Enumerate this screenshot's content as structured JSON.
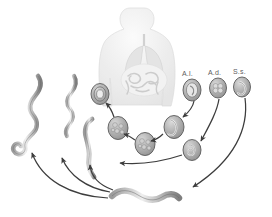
{
  "figure": {
    "background_color": "#ffffff",
    "ink_color": "#4a4a4a",
    "width": 272,
    "height": 217
  },
  "host": {
    "name": "human-body-silhouette",
    "description": "Translucent grey human torso showing lungs and intestinal tract",
    "fill": "#ededed",
    "organ_fill": "#dcdcdc",
    "x": 118,
    "y": 8,
    "w": 52,
    "h": 98
  },
  "species_labels": [
    {
      "id": "ai",
      "text": "A.l.",
      "x": 182,
      "y": 70,
      "egg_cx": 192,
      "egg_cy": 90,
      "egg_rx": 9,
      "egg_ry": 11,
      "egg_type": "ring-ovum"
    },
    {
      "id": "ad",
      "text": "A.d.",
      "x": 208,
      "y": 69,
      "egg_cx": 218,
      "egg_cy": 88,
      "egg_rx": 8.5,
      "egg_ry": 10,
      "egg_type": "cleaved-ovum"
    },
    {
      "id": "ss",
      "text": "S.s.",
      "x": 233,
      "y": 68,
      "egg_cx": 242,
      "egg_cy": 87,
      "egg_rx": 8.5,
      "egg_ry": 10,
      "egg_type": "larvated-ovum"
    }
  ],
  "ova": [
    {
      "id": "ovum-upper-left",
      "cx": 100,
      "cy": 94,
      "rx": 9,
      "ry": 10.5,
      "type": "ring-ovum",
      "stage": "unfertilized egg"
    },
    {
      "id": "ovum-mid-left",
      "cx": 118,
      "cy": 128,
      "rx": 10,
      "ry": 11.5,
      "type": "morula-ovum",
      "stage": "developing morula"
    },
    {
      "id": "ovum-center",
      "cx": 145,
      "cy": 144,
      "rx": 10,
      "ry": 11.5,
      "type": "morula-ovum",
      "stage": "developing morula"
    },
    {
      "id": "ovum-mid-right",
      "cx": 174,
      "cy": 127,
      "rx": 10,
      "ry": 11.5,
      "type": "larvated-ovum",
      "stage": "larvated egg"
    },
    {
      "id": "ovum-lower-right",
      "cx": 192,
      "cy": 150,
      "rx": 9,
      "ry": 10.5,
      "type": "coiled-ovum",
      "stage": "coiled larva in egg"
    }
  ],
  "worms": [
    {
      "id": "adult-worm-1",
      "label": "adult worm, sinuous",
      "x": 22,
      "y": 75,
      "w": 34,
      "h": 72
    },
    {
      "id": "adult-worm-2",
      "label": "adult worm, sinuous",
      "x": 58,
      "y": 75,
      "w": 26,
      "h": 68
    },
    {
      "id": "adult-worm-3",
      "label": "adult worm, slender",
      "x": 80,
      "y": 118,
      "w": 22,
      "h": 62
    },
    {
      "id": "larva-bottom",
      "label": "infective filariform larva",
      "x": 108,
      "y": 180,
      "w": 72,
      "h": 22
    }
  ],
  "arrows": [
    {
      "id": "arrow-ai-to-ovum",
      "from": "A.l. egg",
      "to": "ovum-mid-right"
    },
    {
      "id": "arrow-ad-to-ovum",
      "from": "A.d. egg",
      "to": "ovum-lower-right"
    },
    {
      "id": "arrow-ss-to-larva",
      "from": "S.s. egg",
      "to": "larva-bottom"
    },
    {
      "id": "arrow-midright-to-center",
      "from": "ovum-mid-right",
      "to": "ovum-center"
    },
    {
      "id": "arrow-center-to-midleft",
      "from": "ovum-center",
      "to": "ovum-mid-left"
    },
    {
      "id": "arrow-midleft-to-upper",
      "from": "ovum-mid-left",
      "to": "ovum-upper-left"
    },
    {
      "id": "arrow-larva-to-worm3",
      "from": "larva-bottom",
      "to": "adult-worm-3"
    },
    {
      "id": "arrow-larva-to-worm2",
      "from": "larva-bottom",
      "to": "adult-worm-2"
    },
    {
      "id": "arrow-larva-to-worm1",
      "from": "larva-bottom",
      "to": "adult-worm-1"
    },
    {
      "id": "arrow-lowerright-to-worm3",
      "from": "ovum-lower-right",
      "to": "adult-worm-3"
    }
  ]
}
